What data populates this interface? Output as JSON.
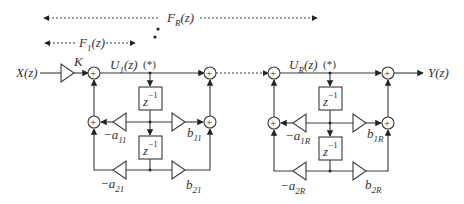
{
  "diagram": {
    "type": "cascade of second-order IIR sections (direct form II)",
    "input_label": "X(z)",
    "output_label": "Y(z)",
    "gain_label": "K",
    "overall_span_label": {
      "main": "F",
      "sub": "R",
      "arg": "(z)"
    },
    "first_span_label": {
      "main": "F",
      "sub": "1",
      "arg": "(z)"
    },
    "sections": [
      {
        "state_label": {
          "main": "U",
          "sub": "1",
          "arg": "(z)"
        },
        "marker": "(*)",
        "delay_label": {
          "main": "z",
          "sup": "−1"
        },
        "coefficients": {
          "a1": {
            "main": "−a",
            "sub": "11"
          },
          "a2": {
            "main": "−a",
            "sub": "21"
          },
          "b1": {
            "main": "b",
            "sub": "11"
          },
          "b2": {
            "main": "b",
            "sub": "21"
          }
        }
      },
      {
        "state_label": {
          "main": "U",
          "sub": "R",
          "arg": "(z)"
        },
        "marker": "(*)",
        "delay_label": {
          "main": "z",
          "sup": "−1"
        },
        "coefficients": {
          "a1": {
            "main": "−a",
            "sub": "1R"
          },
          "a2": {
            "main": "−a",
            "sub": "2R"
          },
          "b1": {
            "main": "b",
            "sub": "1R"
          },
          "b2": {
            "main": "b",
            "sub": "2R"
          }
        }
      }
    ],
    "sum_symbol": "+",
    "ellipsis": "•"
  }
}
